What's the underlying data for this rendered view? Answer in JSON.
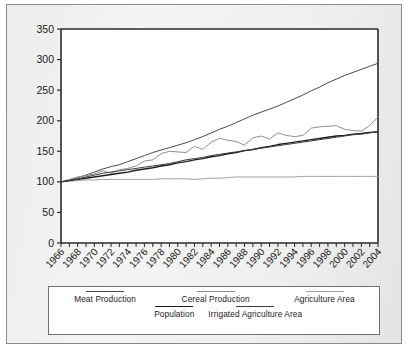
{
  "chart_data": {
    "type": "line",
    "title": "",
    "xlabel": "",
    "ylabel": "",
    "ylim": [
      0,
      350
    ],
    "yticks": [
      0,
      50,
      100,
      150,
      200,
      250,
      300,
      350
    ],
    "xlim": [
      1966,
      2004
    ],
    "xticks": [
      1966,
      1968,
      1970,
      1972,
      1974,
      1976,
      1978,
      1980,
      1982,
      1984,
      1986,
      1988,
      1990,
      1992,
      1994,
      1996,
      1998,
      2000,
      2002,
      2004
    ],
    "grid": false,
    "legend_position": "bottom",
    "x": [
      1966,
      1967,
      1968,
      1969,
      1970,
      1971,
      1972,
      1973,
      1974,
      1975,
      1976,
      1977,
      1978,
      1979,
      1980,
      1981,
      1982,
      1983,
      1984,
      1985,
      1986,
      1987,
      1988,
      1989,
      1990,
      1991,
      1992,
      1993,
      1994,
      1995,
      1996,
      1997,
      1998,
      1999,
      2000,
      2001,
      2002,
      2003,
      2004
    ],
    "series": [
      {
        "name": "Meat Production",
        "color": "#4a4a4a",
        "width": 1.0,
        "values": [
          100,
          103,
          107,
          111,
          116,
          121,
          125,
          128,
          133,
          138,
          143,
          148,
          152,
          156,
          160,
          164,
          169,
          174,
          180,
          186,
          191,
          197,
          203,
          209,
          214,
          219,
          224,
          230,
          236,
          242,
          249,
          255,
          262,
          268,
          274,
          279,
          284,
          289,
          294
        ]
      },
      {
        "name": "Cereal Production",
        "color": "#8f8f8f",
        "width": 1.0,
        "values": [
          100,
          104,
          108,
          110,
          113,
          118,
          114,
          120,
          122,
          126,
          134,
          136,
          146,
          150,
          149,
          148,
          158,
          153,
          165,
          171,
          168,
          166,
          160,
          172,
          175,
          170,
          180,
          176,
          174,
          176,
          188,
          190,
          191,
          192,
          186,
          184,
          183,
          192,
          206
        ]
      },
      {
        "name": "Agriculture Area",
        "color": "#a0a0a0",
        "width": 1.0,
        "values": [
          100,
          101,
          102,
          103,
          103,
          104,
          104,
          104,
          104,
          104,
          104,
          104,
          105,
          105,
          105,
          105,
          104,
          105,
          106,
          106,
          107,
          108,
          108,
          108,
          108,
          108,
          108,
          108,
          108,
          109,
          109,
          109,
          109,
          109,
          109,
          109,
          109,
          109,
          109
        ]
      },
      {
        "name": "Population",
        "color": "#1c1c1c",
        "width": 1.4,
        "values": [
          100,
          102,
          104,
          106,
          108,
          110,
          112,
          114,
          116,
          119,
          121,
          123,
          126,
          128,
          131,
          133,
          136,
          138,
          141,
          143,
          146,
          148,
          151,
          153,
          156,
          158,
          161,
          163,
          165,
          167,
          169,
          171,
          173,
          175,
          176,
          178,
          179,
          181,
          182
        ]
      },
      {
        "name": "Irrigated Agriculture Area",
        "color": "#3d3d3d",
        "width": 1.0,
        "values": [
          100,
          102,
          105,
          108,
          111,
          114,
          116,
          118,
          120,
          122,
          124,
          126,
          128,
          130,
          133,
          136,
          138,
          140,
          143,
          145,
          147,
          149,
          151,
          153,
          155,
          157,
          159,
          161,
          163,
          165,
          167,
          169,
          171,
          173,
          175,
          177,
          178,
          180,
          182
        ]
      }
    ]
  },
  "legend": {
    "row1": [
      {
        "label": "Meat Production",
        "color": "#4a4a4a"
      },
      {
        "label": "Cereal Production",
        "color": "#8f8f8f"
      },
      {
        "label": "Agriculture Area",
        "color": "#a0a0a0"
      }
    ],
    "row2": [
      {
        "label": "Population",
        "color": "#1c1c1c"
      },
      {
        "label": "Irrigated Agriculture Area",
        "color": "#3d3d3d"
      }
    ]
  },
  "axis": {
    "y_labels": [
      "350",
      "300",
      "250",
      "200",
      "150",
      "100",
      "50",
      "0"
    ],
    "x_labels": [
      "1966",
      "1968",
      "1970",
      "1972",
      "1974",
      "1976",
      "1978",
      "1980",
      "1982",
      "1984",
      "1986",
      "1988",
      "1990",
      "1992",
      "1994",
      "1996",
      "1998",
      "2000",
      "2002",
      "2004"
    ]
  }
}
